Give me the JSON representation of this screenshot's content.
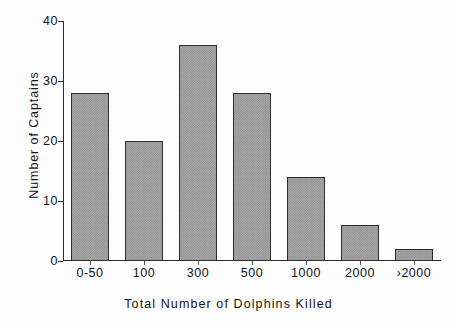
{
  "chart_data": {
    "type": "bar",
    "title": "",
    "xlabel": "Total Number of Dolphins Killed",
    "ylabel": "Number of Captains",
    "categories": [
      "0-50",
      "100",
      "300",
      "500",
      "1000",
      "2000",
      "›2000"
    ],
    "values": [
      28,
      20,
      36,
      28,
      14,
      6,
      2
    ],
    "ylim": [
      0,
      40
    ],
    "yticks": [
      0,
      10,
      20,
      30,
      40
    ],
    "ytick_labels": [
      "0",
      "10",
      "20",
      "30",
      "40"
    ],
    "grid": false,
    "legend": null,
    "bar_color": "#a8a8a8",
    "bar_edge_color": "#2e2e2e",
    "axis_color": "#2b2b2b",
    "background_color": "#ffffff"
  }
}
